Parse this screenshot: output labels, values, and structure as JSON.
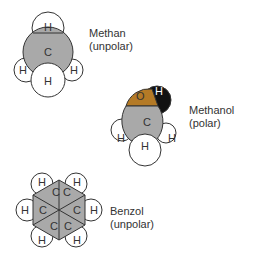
{
  "colors": {
    "carbon": "#a9a9a9",
    "oxygen": "#b47a26",
    "hydroxyl_h": "#111111",
    "hydrogen": "#ffffff",
    "outline": "#333333",
    "text": "#333333"
  },
  "molecules": [
    {
      "name": "Methan",
      "polarity": "(unpolar)",
      "atoms": {
        "c": "C",
        "h_top": "H",
        "h_left": "H",
        "h_bottom": "H",
        "h_right": "H"
      }
    },
    {
      "name": "Methanol",
      "polarity": "(polar)",
      "atoms": {
        "o": "O",
        "h_oh": "H",
        "c": "C",
        "h_left": "H",
        "h_bottom": "H",
        "h_right": "H"
      }
    },
    {
      "name": "Benzol",
      "polarity": "(unpolar)",
      "atoms": {
        "c": [
          "C",
          "C",
          "C",
          "C",
          "C",
          "C"
        ],
        "h": [
          "H",
          "H",
          "H",
          "H",
          "H",
          "H"
        ]
      }
    }
  ]
}
